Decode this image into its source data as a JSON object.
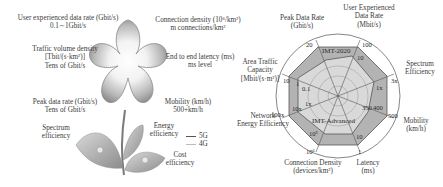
{
  "left_panel": {
    "user_rate": {
      "title": "User experienced data rate (Gbit/s)",
      "value": "0.1∼1Gbit/s"
    },
    "connection_density": {
      "title": "Connection density (10⁶/km²)",
      "value": "m connections/km²"
    },
    "traffic_density": {
      "title": "Traffic volume density",
      "unit": "[Tbit/(s·km²)]",
      "value": "Tens of Gbit/s"
    },
    "latency": {
      "title": "End to end latency (ms)",
      "value": "ms level"
    },
    "peak_rate": {
      "title": "Peak data rate (Gbit/s)",
      "value": "Tens of Gbit/s"
    },
    "mobility": {
      "title": "Mobility (km/h)",
      "value": "500+km/h"
    },
    "spectrum": {
      "line1": "Spectrum",
      "line2": "efficiency"
    },
    "energy": {
      "line1": "Energy",
      "line2": "efficiency"
    },
    "cost": {
      "line1": "Cost",
      "line2": "efficiency"
    },
    "legend": [
      {
        "label": "5G",
        "color": "#555555"
      },
      {
        "label": "4G",
        "color": "#bbbbbb"
      }
    ]
  },
  "radar": {
    "outer_label": "IMT-2020",
    "inner_label": "IMT-Advanced",
    "axes": [
      {
        "name": "Peak Data Rate",
        "unit": "(Gbit/s)",
        "outer": "20",
        "inner": "1"
      },
      {
        "name": "User Experienced Data Rate",
        "name2": "Data Rate",
        "unit": "(Mbit/s)",
        "outer": "100",
        "inner": "10"
      },
      {
        "name": "Spectrum",
        "name2": "Efficiency",
        "outer": "3x",
        "inner": "1x"
      },
      {
        "name": "Mobility",
        "unit": "(km/h)",
        "outer": "500",
        "inner": "350",
        "inner2": "400"
      },
      {
        "name": "Latency",
        "unit": "(ms)",
        "outer": "1",
        "inner": "10"
      },
      {
        "name": "Connection Density",
        "unit": "(devices/km²)",
        "outer": "10⁶",
        "inner": "10⁵"
      },
      {
        "name": "Network",
        "name2": "Energy Efficiency",
        "outer": "100x",
        "inner": "1x",
        "inner_mid": "10x"
      },
      {
        "name": "Area Traffic",
        "name2": "Capacity",
        "unit": "[Mbit/(s·m²)]",
        "outer": "10",
        "inner": "0.1",
        "inner_mid": "1"
      }
    ]
  }
}
